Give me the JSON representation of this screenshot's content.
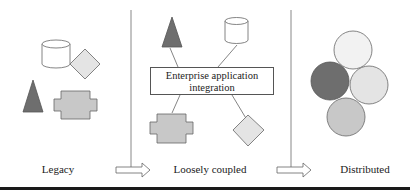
{
  "diagram": {
    "panels": [
      {
        "id": "legacy",
        "label": "Legacy"
      },
      {
        "id": "loosely-coupled",
        "label": "Loosely coupled",
        "hub_label_line1": "Enterprise application",
        "hub_label_line2": "integration"
      },
      {
        "id": "distributed",
        "label": "Distributed"
      }
    ],
    "colors": {
      "dark_fill": "#6e6e6e",
      "medium_fill": "#c8c8c8",
      "light_fill": "#e4e4e4",
      "very_light_fill": "#f2f2f2",
      "white_fill": "#ffffff",
      "stroke": "#555555",
      "divider": "#888888",
      "bottom_bar": "#1a1a1a"
    },
    "legacy_shapes": [
      "cylinder",
      "diamond",
      "triangle",
      "cross-block"
    ],
    "loosely_coupled_shapes": [
      "triangle",
      "cylinder",
      "cross-block",
      "diamond"
    ],
    "distributed_nodes": [
      {
        "position": "top",
        "shade": "very-light"
      },
      {
        "position": "left",
        "shade": "dark"
      },
      {
        "position": "right",
        "shade": "light"
      },
      {
        "position": "bottom",
        "shade": "medium"
      }
    ]
  }
}
